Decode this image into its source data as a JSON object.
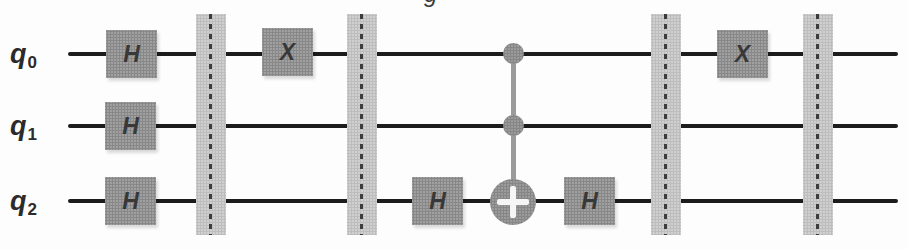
{
  "figure": {
    "type": "quantum-circuit",
    "caption_fragment": "g",
    "qubits": [
      {
        "name": "q0",
        "base": "q",
        "sub": "0"
      },
      {
        "name": "q1",
        "base": "q",
        "sub": "1"
      },
      {
        "name": "q2",
        "base": "q",
        "sub": "2"
      }
    ],
    "gates": [
      {
        "label": "H",
        "qubit": "q0",
        "column": 1
      },
      {
        "label": "H",
        "qubit": "q1",
        "column": 1
      },
      {
        "label": "H",
        "qubit": "q2",
        "column": 1
      },
      {
        "label": "X",
        "qubit": "q0",
        "column": 2
      },
      {
        "label": "H",
        "qubit": "q2",
        "column": 3
      },
      {
        "label": "H",
        "qubit": "q2",
        "column": 5
      },
      {
        "label": "X",
        "qubit": "q0",
        "column": 6
      }
    ],
    "ccx": {
      "controls": [
        "q0",
        "q1"
      ],
      "target": "q2",
      "target_symbol": "plus"
    },
    "barrier_count": 4,
    "colors": {
      "gate_fill": "#a0a0a0",
      "barrier_fill": "#d0d0d0",
      "wire": "#1c1c1c",
      "gate_text": "#383838",
      "label_text": "#2b2b2b",
      "target_plus": "#f5f5f5"
    }
  }
}
